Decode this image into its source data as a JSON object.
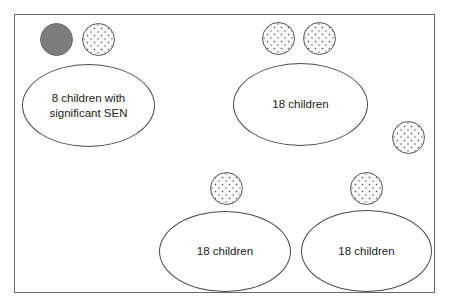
{
  "diagram": {
    "type": "classroom seating layout",
    "frame": {
      "stroke": "#6a6a6a"
    },
    "groups": [
      {
        "id": "group-sen",
        "label": "8 children with\nsignificant SEN",
        "children_count": 8
      },
      {
        "id": "group-top-right",
        "label": "18 children",
        "children_count": 18
      },
      {
        "id": "group-bottom-middle",
        "label": "18 children",
        "children_count": 18
      },
      {
        "id": "group-bottom-right",
        "label": "18 children",
        "children_count": 18
      }
    ],
    "adults": [
      {
        "style": "filled",
        "color": "#7d7d7d",
        "near": "group-sen"
      },
      {
        "style": "dotted",
        "near": "group-sen"
      },
      {
        "style": "dotted",
        "near": "group-top-right"
      },
      {
        "style": "dotted",
        "near": "group-top-right"
      },
      {
        "style": "dotted",
        "near": "group-top-right"
      },
      {
        "style": "dotted",
        "near": "group-bottom-middle"
      },
      {
        "style": "dotted",
        "near": "group-bottom-right"
      }
    ]
  }
}
